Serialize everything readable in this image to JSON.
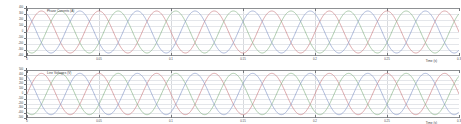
{
  "figure": {
    "background_color": "#ffffff",
    "frame_color": "#8f9194",
    "grid_color": "#d7d9dd",
    "tick_color": "#76797d",
    "text_color": "#3a3c40"
  },
  "subplots": [
    {
      "name": "top",
      "title": "Phase Currents (A)",
      "xlabel": "Time (s)",
      "ylabel": "",
      "series_colors": [
        "#c8787c",
        "#7fae7f",
        "#7f93c4"
      ],
      "yticks": [
        "400",
        "300",
        "200",
        "100",
        "0",
        "-100",
        "-200",
        "-300",
        "-400"
      ],
      "xticks": [
        "0",
        "0.05",
        "0.1",
        "0.15",
        "0.2",
        "0.25",
        "0.3"
      ]
    },
    {
      "name": "bottom",
      "title": "Line Voltages (V)",
      "xlabel": "Time (s)",
      "ylabel": "",
      "series_colors": [
        "#c8787c",
        "#7fae7f",
        "#7f93c4"
      ],
      "yticks": [
        "500",
        "400",
        "300",
        "200",
        "100",
        "0",
        "-100",
        "-200",
        "-300",
        "-400",
        "-500"
      ],
      "xticks": [
        "0",
        "0.05",
        "0.1",
        "0.15",
        "0.2",
        "0.25",
        "0.3"
      ]
    }
  ],
  "chart_data": [
    {
      "type": "line",
      "title": "Phase Currents (A)",
      "xlabel": "Time (s)",
      "ylabel": "",
      "xlim": [
        0,
        0.3
      ],
      "ylim": [
        -400,
        400
      ],
      "grid": true,
      "legend_position": "none",
      "x_tick_values": [
        0,
        0.05,
        0.1,
        0.15,
        0.2,
        0.25,
        0.3
      ],
      "y_tick_values": [
        400,
        300,
        200,
        100,
        0,
        -100,
        -200,
        -300,
        -400
      ],
      "series": [
        {
          "name": "Phase A",
          "color": "#c8787c",
          "waveform": "sine",
          "amplitude": 350,
          "frequency_hz": 25,
          "phase_deg": 0,
          "offset": 0
        },
        {
          "name": "Phase B",
          "color": "#7fae7f",
          "waveform": "sine",
          "amplitude": 350,
          "frequency_hz": 25,
          "phase_deg": -120,
          "offset": 0
        },
        {
          "name": "Phase C",
          "color": "#7f93c4",
          "waveform": "sine",
          "amplitude": 350,
          "frequency_hz": 25,
          "phase_deg": 120,
          "offset": 0
        }
      ]
    },
    {
      "type": "line",
      "title": "Line Voltages (V)",
      "xlabel": "Time (s)",
      "ylabel": "",
      "xlim": [
        0,
        0.3
      ],
      "ylim": [
        -500,
        500
      ],
      "grid": true,
      "legend_position": "none",
      "x_tick_values": [
        0,
        0.05,
        0.1,
        0.15,
        0.2,
        0.25,
        0.3
      ],
      "y_tick_values": [
        500,
        400,
        300,
        200,
        100,
        0,
        -100,
        -200,
        -300,
        -400,
        -500
      ],
      "series": [
        {
          "name": "Vab",
          "color": "#c8787c",
          "waveform": "sine",
          "amplitude": 430,
          "frequency_hz": 25,
          "phase_deg": 0,
          "offset": 0
        },
        {
          "name": "Vbc",
          "color": "#7fae7f",
          "waveform": "sine",
          "amplitude": 430,
          "frequency_hz": 25,
          "phase_deg": -120,
          "offset": 0
        },
        {
          "name": "Vca",
          "color": "#7f93c4",
          "waveform": "sine",
          "amplitude": 430,
          "frequency_hz": 25,
          "phase_deg": 120,
          "offset": 0
        }
      ]
    }
  ]
}
